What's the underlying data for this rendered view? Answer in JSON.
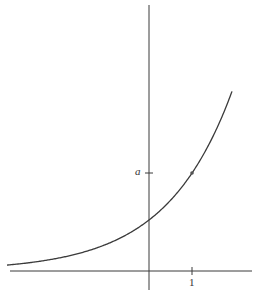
{
  "figure": {
    "type": "exponential-graph",
    "function": "y = a^x",
    "labels": {
      "y_tick": "a",
      "x_tick": "1"
    },
    "colors": {
      "background": "#ffffff",
      "stroke": "#3a3a3a"
    }
  }
}
